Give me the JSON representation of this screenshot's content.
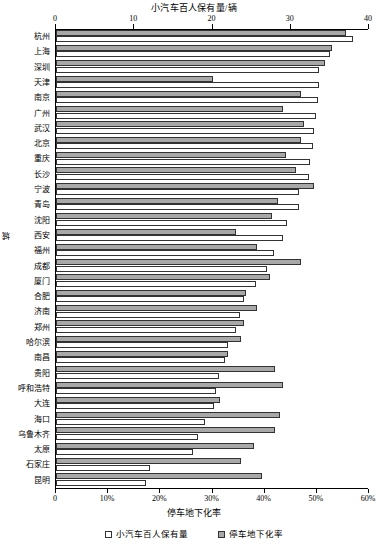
{
  "chart_data": {
    "type": "bar",
    "orientation": "horizontal",
    "title": "小汽车百人保有量/辆",
    "xlabel": "停车地下化率",
    "ylabel": "城",
    "grid": false,
    "legend_position": "bottom",
    "top_axis": {
      "label": "小汽车百人保有量/辆",
      "ticks": [
        0,
        10,
        20,
        30,
        40
      ],
      "tick_labels": [
        "0",
        "10",
        "20",
        "30",
        "40"
      ],
      "lim": [
        0,
        40
      ]
    },
    "bottom_axis": {
      "label": "停车地下化率",
      "ticks": [
        0,
        10,
        20,
        30,
        40,
        50,
        60
      ],
      "tick_labels": [
        "0",
        "10%",
        "20%",
        "30%",
        "40%",
        "50%",
        "60%"
      ],
      "lim": [
        0,
        60
      ]
    },
    "categories": [
      "杭州",
      "上海",
      "深圳",
      "天津",
      "南京",
      "广州",
      "武汉",
      "北京",
      "重庆",
      "长沙",
      "宁波",
      "青岛",
      "沈阳",
      "西安",
      "福州",
      "成都",
      "厦门",
      "合肥",
      "济南",
      "郑州",
      "哈尔滨",
      "南昌",
      "贵阳",
      "呼和浩特",
      "大连",
      "海口",
      "乌鲁木齐",
      "太原",
      "石家庄",
      "昆明"
    ],
    "series": [
      {
        "name": "小汽车百人保有量",
        "axis": "top",
        "unit": "辆",
        "color": "#ffffff",
        "values": [
          38.0,
          35.0,
          33.6,
          33.6,
          33.5,
          33.2,
          33.0,
          32.8,
          32.5,
          32.3,
          31.0,
          31.0,
          29.5,
          29.0,
          27.8,
          27.0,
          25.5,
          24.0,
          23.5,
          23.0,
          22.0,
          21.6,
          20.8,
          20.5,
          20.2,
          19.0,
          18.2,
          17.5,
          12.0,
          11.5
        ]
      },
      {
        "name": "停车地下化率",
        "axis": "bottom",
        "unit": "%",
        "color": "#a8a8a8",
        "values": [
          55.5,
          53.0,
          51.5,
          30.0,
          47.0,
          43.5,
          47.5,
          47.0,
          44.0,
          46.0,
          49.5,
          42.5,
          41.5,
          34.5,
          38.5,
          47.0,
          41.0,
          36.5,
          38.5,
          36.0,
          35.5,
          33.0,
          42.0,
          43.5,
          31.5,
          43.0,
          42.0,
          38.0,
          35.5,
          39.5
        ]
      }
    ],
    "legend": [
      {
        "label": "小汽车百人保有量",
        "swatch": "white"
      },
      {
        "label": "停车地下化率",
        "swatch": "gray"
      }
    ]
  },
  "colors": {
    "bar_rate": "#a8a8a8",
    "bar_own": "#ffffff",
    "axis": "#000000",
    "background": "#ffffff"
  }
}
